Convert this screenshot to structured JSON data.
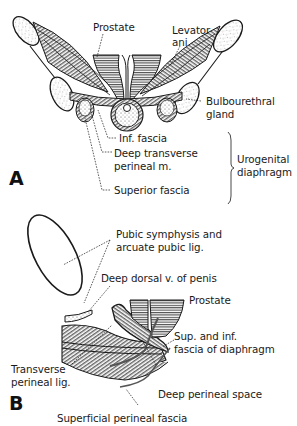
{
  "figure": {
    "panel_a": {
      "letter": "A",
      "labels": {
        "prostate": "Prostate",
        "levator_ani_1": "Levator",
        "levator_ani_2": "ani",
        "bulbourethral_1": "Bulbourethral",
        "bulbourethral_2": "gland",
        "inf_fascia": "Inf. fascia",
        "deep_transverse_1": "Deep transverse",
        "deep_transverse_2": "perineal m.",
        "superior_fascia": "Superior fascia",
        "urogenital_1": "Urogenital",
        "urogenital_2": "diaphragm"
      }
    },
    "panel_b": {
      "letter": "B",
      "labels": {
        "pubic_symphysis_1": "Pubic symphysis and",
        "pubic_symphysis_2": "arcuate pubic lig.",
        "deep_dorsal": "Deep dorsal v. of penis",
        "prostate": "Prostate",
        "sup_inf_fascia_1": "Sup. and inf.",
        "sup_inf_fascia_2": "fascia of diaphragm",
        "transverse_perineal_1": "Transverse",
        "transverse_perineal_2": "perineal lig.",
        "deep_perineal_space": "Deep perineal space",
        "superficial_perineal_fascia": "Superficial perineal fascia"
      }
    },
    "colors": {
      "ink": "#1a1a1a",
      "background": "#ffffff",
      "stipple": "#555555"
    }
  }
}
